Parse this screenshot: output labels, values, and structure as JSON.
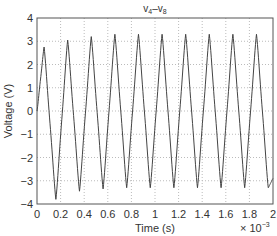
{
  "chart_data": {
    "type": "line",
    "title": "v4–v8",
    "title_parts": {
      "base1": "v",
      "sub1": "4",
      "dash": "–",
      "base2": "v",
      "sub2": "8"
    },
    "xlabel": "Time (s)",
    "ylabel": "Voltage (V)",
    "x_multiplier": "× 10",
    "x_multiplier_exp": "−3",
    "xlim": [
      0,
      2
    ],
    "ylim": [
      -4,
      4
    ],
    "xticks": [
      "0",
      "0.2",
      "0.4",
      "0.6",
      "0.8",
      "1",
      "1.2",
      "1.4",
      "1.6",
      "1.8",
      "2"
    ],
    "yticks": [
      "4",
      "3",
      "2",
      "1",
      "0",
      "−1",
      "−2",
      "−3",
      "−4"
    ],
    "grid": true,
    "grid_style": "dotted",
    "legend": null,
    "series": [
      {
        "name": "v4–v8",
        "color": "#444444",
        "description": "Periodic voltage waveform, period ≈ 0.2 ms (≈5 kHz), ~10 cycles; amplitude settles after startup transient",
        "period_ms": 0.2,
        "peaks": [
          {
            "t": 0.06,
            "v": 2.75
          },
          {
            "t": 0.26,
            "v": 3.05
          },
          {
            "t": 0.46,
            "v": 3.2
          },
          {
            "t": 0.66,
            "v": 3.3
          },
          {
            "t": 0.86,
            "v": 3.3
          },
          {
            "t": 1.06,
            "v": 3.3
          },
          {
            "t": 1.26,
            "v": 3.3
          },
          {
            "t": 1.46,
            "v": 3.3
          },
          {
            "t": 1.66,
            "v": 3.3
          },
          {
            "t": 1.86,
            "v": 3.3
          }
        ],
        "troughs": [
          {
            "t": 0.16,
            "v": -3.8
          },
          {
            "t": 0.36,
            "v": -3.45
          },
          {
            "t": 0.56,
            "v": -3.35
          },
          {
            "t": 0.76,
            "v": -3.3
          },
          {
            "t": 0.96,
            "v": -3.3
          },
          {
            "t": 1.16,
            "v": -3.3
          },
          {
            "t": 1.36,
            "v": -3.3
          },
          {
            "t": 1.56,
            "v": -3.3
          },
          {
            "t": 1.76,
            "v": -3.3
          },
          {
            "t": 1.96,
            "v": -3.3
          }
        ]
      }
    ]
  }
}
